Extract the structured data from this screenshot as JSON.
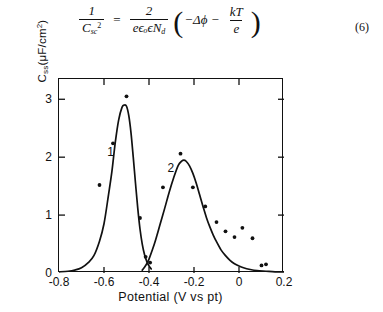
{
  "equation": {
    "label": "(6)",
    "lhs": {
      "numerator": "1",
      "denominator_base": "C",
      "denominator_sub": "sc",
      "denominator_sup": "2"
    },
    "relation": "=",
    "rhs_fraction": {
      "numerator": "2",
      "denominator": "eϵₒϵN",
      "denominator_sub": "d"
    },
    "paren_open": "(",
    "paren_close": ")",
    "term1": "−Δϕ",
    "operator": "−",
    "term2": {
      "numerator": "kT",
      "denominator": "e"
    },
    "plain_text": "1/C_sc^2 = 2/(eεₒεN_d) ( −Δϕ − kT/e )"
  },
  "chart_data": {
    "type": "line",
    "title": "",
    "xlabel": "Potential (V vs pt)",
    "ylabel": "C_ss (μF/cm²)",
    "xlabel_parts": {
      "name": "Potential",
      "units": "(V vs pt)"
    },
    "ylabel_parts": {
      "symbol": "C",
      "subscript": "ss",
      "units": "(μF/cm",
      "units_sup": "2",
      "units_close": ")"
    },
    "xlim": [
      -0.8,
      0.2
    ],
    "ylim": [
      0,
      3.35
    ],
    "xticks": [
      -0.8,
      -0.6,
      -0.4,
      -0.2,
      0,
      0.2
    ],
    "xtick_labels": [
      "-0.8",
      "-0.6",
      "-0.4",
      "-0.2",
      "0",
      "0.2"
    ],
    "yticks": [
      0,
      1,
      2,
      3
    ],
    "ytick_labels": [
      "0",
      "1",
      "2",
      "3"
    ],
    "grid": false,
    "legend": false,
    "tick_direction": "inward",
    "frame": "box",
    "annotations": [
      {
        "text": "1",
        "x": -0.572,
        "y": 2.07
      },
      {
        "text": "2",
        "x": -0.305,
        "y": 1.8
      }
    ],
    "series": [
      {
        "name": "1",
        "label": "1",
        "color": "#111111",
        "peak_x": -0.5,
        "peak_y": 2.9,
        "curve_x": [
          -0.8,
          -0.76,
          -0.73,
          -0.7,
          -0.67,
          -0.645,
          -0.62,
          -0.6,
          -0.58,
          -0.565,
          -0.55,
          -0.535,
          -0.52,
          -0.51,
          -0.5,
          -0.49,
          -0.48,
          -0.47,
          -0.46,
          -0.45,
          -0.44,
          -0.43,
          -0.42,
          -0.41,
          -0.4,
          -0.39
        ],
        "curve_y": [
          0.02,
          0.03,
          0.05,
          0.09,
          0.18,
          0.3,
          0.55,
          0.85,
          1.35,
          1.75,
          2.25,
          2.64,
          2.86,
          2.9,
          2.88,
          2.72,
          2.42,
          2.0,
          1.55,
          1.12,
          0.76,
          0.5,
          0.32,
          0.2,
          0.12,
          0.07
        ],
        "points_x": [
          -0.62,
          -0.56,
          -0.5,
          -0.44,
          -0.415,
          -0.395
        ],
        "points_y": [
          1.52,
          2.24,
          3.05,
          0.95,
          0.28,
          0.18
        ]
      },
      {
        "name": "2",
        "label": "2",
        "color": "#111111",
        "peak_x": -0.245,
        "peak_y": 1.95,
        "curve_x": [
          -0.43,
          -0.42,
          -0.41,
          -0.4,
          -0.385,
          -0.37,
          -0.35,
          -0.33,
          -0.31,
          -0.29,
          -0.27,
          -0.255,
          -0.245,
          -0.235,
          -0.22,
          -0.205,
          -0.19,
          -0.175,
          -0.16,
          -0.145,
          -0.13,
          -0.115,
          -0.1,
          -0.08,
          -0.06,
          -0.04,
          -0.02,
          0.0,
          0.02,
          0.05,
          0.08,
          0.12,
          0.16,
          0.2
        ],
        "curve_y": [
          0.05,
          0.1,
          0.16,
          0.24,
          0.4,
          0.58,
          0.85,
          1.12,
          1.4,
          1.65,
          1.86,
          1.93,
          1.95,
          1.93,
          1.85,
          1.72,
          1.55,
          1.35,
          1.15,
          0.96,
          0.8,
          0.66,
          0.54,
          0.4,
          0.3,
          0.22,
          0.16,
          0.12,
          0.09,
          0.06,
          0.04,
          0.03,
          0.02,
          0.02
        ],
        "points_x": [
          -0.338,
          -0.26,
          -0.205,
          -0.15,
          -0.1,
          -0.06,
          -0.02,
          0.015,
          0.06,
          0.1,
          0.12
        ],
        "points_y": [
          1.48,
          2.06,
          1.48,
          1.15,
          0.88,
          0.72,
          0.62,
          0.78,
          0.6,
          0.13,
          0.15
        ]
      }
    ]
  }
}
